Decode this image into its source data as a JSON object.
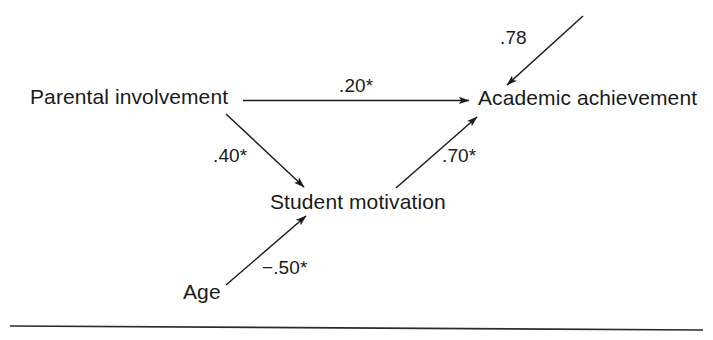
{
  "figure": {
    "type": "path-diagram",
    "background_color": "#ffffff",
    "ink_color": "#1a1a1a",
    "width": 713,
    "height": 340
  },
  "nodes": [
    {
      "id": "parental_involvement",
      "label": "Parental involvement",
      "x": 30,
      "y": 86
    },
    {
      "id": "academic_achievement",
      "label": "Academic achievement",
      "x": 478,
      "y": 87
    },
    {
      "id": "student_motivation",
      "label": "Student motivation",
      "x": 270,
      "y": 191
    },
    {
      "id": "age",
      "label": "Age",
      "x": 183,
      "y": 281
    }
  ],
  "paths": [
    {
      "id": "pi_to_aa",
      "from": "parental_involvement",
      "to": "academic_achievement",
      "coefficient": ".20*",
      "significant": true,
      "value": 0.2,
      "direction": "horizontal-right",
      "label_x": 339,
      "label_y": 76
    },
    {
      "id": "pi_to_sm",
      "from": "parental_involvement",
      "to": "student_motivation",
      "coefficient": ".40*",
      "significant": true,
      "value": 0.4,
      "direction": "diagonal-down-right",
      "label_x": 213,
      "label_y": 146
    },
    {
      "id": "sm_to_aa",
      "from": "student_motivation",
      "to": "academic_achievement",
      "coefficient": ".70*",
      "significant": true,
      "value": 0.7,
      "direction": "diagonal-up-right",
      "label_x": 442,
      "label_y": 146
    },
    {
      "id": "age_to_sm",
      "from": "age",
      "to": "student_motivation",
      "coefficient": "−.50*",
      "significant": true,
      "value": -0.5,
      "direction": "diagonal-up-right",
      "label_x": 262,
      "label_y": 258
    },
    {
      "id": "disturbance_to_aa",
      "from": "disturbance",
      "to": "academic_achievement",
      "coefficient": ".78",
      "significant": false,
      "value": 0.78,
      "direction": "diagonal-down-left",
      "label_x": 500,
      "label_y": 28
    }
  ],
  "rule": {
    "id": "bottom-rule",
    "visible": true,
    "y": 327
  }
}
